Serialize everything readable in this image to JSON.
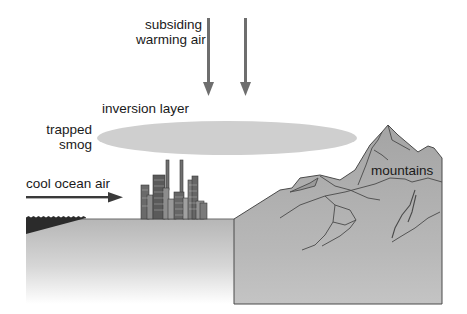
{
  "diagram": {
    "labels": {
      "subsiding_line1": "subsiding",
      "subsiding_line2": "warming air",
      "inversion_layer": "inversion layer",
      "trapped_line1": "trapped",
      "trapped_line2": "smog",
      "cool_ocean_air": "cool ocean air",
      "mountains": "mountains"
    },
    "elements": [
      {
        "id": "subsiding-air-arrows",
        "type": "arrow",
        "count": 2,
        "direction": "down"
      },
      {
        "id": "inversion-layer",
        "type": "ellipse"
      },
      {
        "id": "city",
        "type": "buildings"
      },
      {
        "id": "cool-ocean-air-arrow",
        "type": "arrow",
        "direction": "right"
      },
      {
        "id": "ocean",
        "type": "water"
      },
      {
        "id": "ground",
        "type": "land"
      },
      {
        "id": "mountains",
        "type": "terrain"
      }
    ],
    "colors": {
      "arrow_gray": "#6e6e6e",
      "ellipse_gray": "#cfcfcf",
      "ground_top": "#b8b8b8",
      "mountain_fill": "#a9a9a9",
      "ocean_dark": "#2b2b2b",
      "outline": "#4a4a4a",
      "text": "#1a1a1a"
    }
  }
}
